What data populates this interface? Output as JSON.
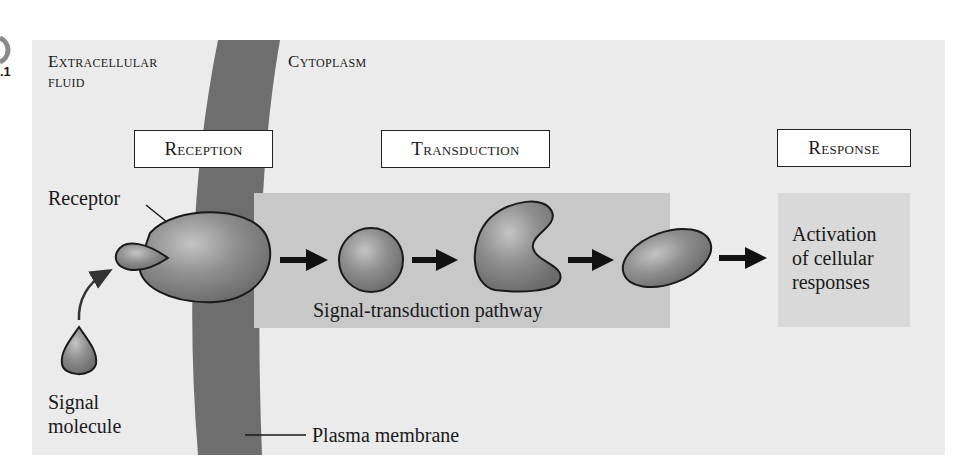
{
  "figure": {
    "figure_number_fragment": ".1",
    "regions": {
      "extracellular": "Extracellular fluid",
      "extracellular_line1": "Extracellular",
      "extracellular_line2": "fluid",
      "cytoplasm": "Cytoplasm"
    },
    "stages": [
      {
        "label": "Reception"
      },
      {
        "label": "Transduction"
      },
      {
        "label": "Response"
      }
    ],
    "labels": {
      "receptor": "Receptor",
      "signal_molecule_line1": "Signal",
      "signal_molecule_line2": "molecule",
      "plasma_membrane": "Plasma membrane",
      "pathway": "Signal-transduction pathway",
      "response_line1": "Activation",
      "response_line2": "of cellular",
      "response_line3": "responses"
    },
    "colors": {
      "panel_bg": "#ebebeb",
      "membrane": "#6e6e6e",
      "transduction_box": "#c8c8c8",
      "response_box": "#d9d9d9",
      "molecule_fill": "#8c8c8c",
      "outline": "#1a1a1a"
    }
  }
}
